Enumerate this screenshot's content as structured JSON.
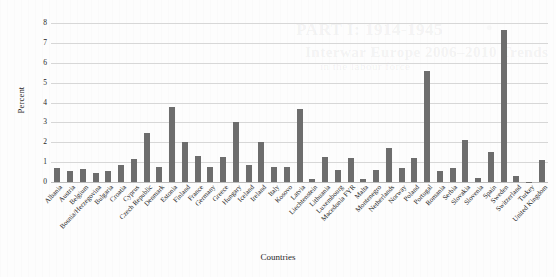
{
  "chart_data": {
    "type": "bar",
    "title": "",
    "xlabel": "Countries",
    "ylabel": "Percent",
    "ylim": [
      0,
      8
    ],
    "yticks": [
      0,
      1,
      2,
      3,
      4,
      5,
      6,
      7,
      8
    ],
    "grid": true,
    "legend": "none",
    "bar_color": "#6d6d6d",
    "categories": [
      "Albania",
      "Austria",
      "Belgium",
      "Bosnia/Herzegovina",
      "Bulgaria",
      "Croatia",
      "Cyprus",
      "Czech Republic",
      "Denmark",
      "Estonia",
      "Finland",
      "France",
      "Germany",
      "Greece",
      "Hungary",
      "Iceland",
      "Ireland",
      "Italy",
      "Kosovo",
      "Latvia",
      "Liechtenstein",
      "Lithuania",
      "Luxembourg",
      "Macedonia FYR",
      "Malta",
      "Montenegro",
      "Netherlands",
      "Norway",
      "Poland",
      "Portugal",
      "Romania",
      "Serbia",
      "Slovakia",
      "Slovenia",
      "Spain",
      "Sweden",
      "Switzerland",
      "Turkey",
      "United Kingdom"
    ],
    "values": [
      0.72,
      0.55,
      0.66,
      0.47,
      0.55,
      0.85,
      1.15,
      2.47,
      0.76,
      3.77,
      2.02,
      1.31,
      0.77,
      1.27,
      3.02,
      0.88,
      2.02,
      0.76,
      0.75,
      3.67,
      0.16,
      1.25,
      0.6,
      1.2,
      0.13,
      0.58,
      1.7,
      0.73,
      1.19,
      5.6,
      0.53,
      0.69,
      2.1,
      0.21,
      1.53,
      7.65,
      0.29,
      0.02,
      1.1
    ]
  },
  "background_marks": {
    "ghost_line_1": "PART I: 1914-1945",
    "ghost_line_2": "Interwar Europe 2006–2010 Trends",
    "ghost_line_3": "in the labour force"
  }
}
